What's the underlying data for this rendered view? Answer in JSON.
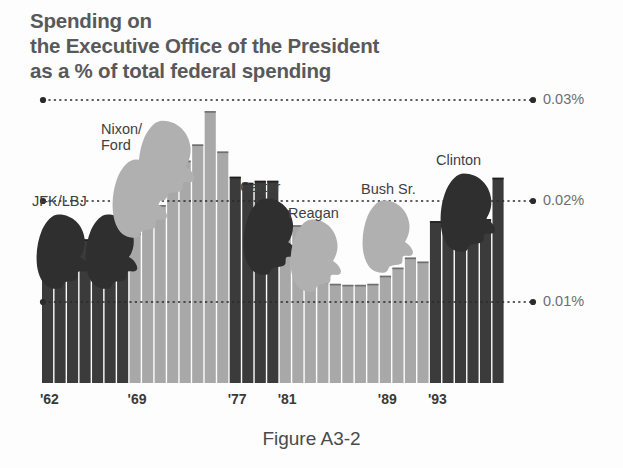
{
  "title": {
    "line1": "Spending on",
    "line2": "the Executive Office of the President",
    "line3": "as a % of total federal spending"
  },
  "caption": "Figure A3-2",
  "colors": {
    "dark_bar": "#3b3b3b",
    "light_bar": "#a8a8a8",
    "title_text": "#58595b",
    "axis_text": "#6d6e71",
    "gridline": "#2b2b2b",
    "background": "#fdfdfd"
  },
  "chart_data": {
    "type": "bar",
    "title": "Spending on the Executive Office of the President as a % of total federal spending",
    "xlabel": "",
    "ylabel": "",
    "ylim": [
      0,
      0.032
    ],
    "grid": true,
    "gridlines": [
      {
        "value": 0.03,
        "label": "0.03%"
      },
      {
        "value": 0.02,
        "label": "0.02%"
      },
      {
        "value": 0.01,
        "label": "0.01%"
      }
    ],
    "ytick_labels": [
      "0.03%",
      "0.02%",
      "0.01%"
    ],
    "xtick_labels": [
      "'62",
      "'69",
      "'77",
      "'81",
      "'89",
      "'93"
    ],
    "xtick_years": [
      1962,
      1969,
      1977,
      1981,
      1989,
      1993
    ],
    "legend_position": "none",
    "categories": [
      1962,
      1963,
      1964,
      1965,
      1966,
      1967,
      1968,
      1969,
      1970,
      1971,
      1972,
      1973,
      1974,
      1975,
      1976,
      1977,
      1978,
      1979,
      1980,
      1981,
      1982,
      1983,
      1984,
      1985,
      1986,
      1987,
      1988,
      1989,
      1990,
      1991,
      1992,
      1993,
      1994,
      1995,
      1996,
      1997,
      1998
    ],
    "values": [
      0.0148,
      0.015,
      0.0155,
      0.0162,
      0.0148,
      0.015,
      0.0155,
      0.0168,
      0.018,
      0.0196,
      0.0216,
      0.024,
      0.0256,
      0.0289,
      0.0249,
      0.0224,
      0.0218,
      0.022,
      0.022,
      0.0191,
      0.0176,
      0.0172,
      0.012,
      0.0118,
      0.0117,
      0.0117,
      0.0118,
      0.0126,
      0.0134,
      0.0144,
      0.014,
      0.018,
      0.0195,
      0.0168,
      0.018,
      0.0182,
      0.0223
    ],
    "bar_group_shade": [
      "dark",
      "dark",
      "dark",
      "dark",
      "dark",
      "dark",
      "dark",
      "light",
      "light",
      "light",
      "light",
      "light",
      "light",
      "light",
      "light",
      "dark",
      "dark",
      "dark",
      "dark",
      "light",
      "light",
      "light",
      "light",
      "light",
      "light",
      "light",
      "light",
      "light",
      "light",
      "light",
      "light",
      "dark",
      "dark",
      "dark",
      "dark",
      "dark",
      "dark"
    ],
    "annotations": [
      {
        "label": "JFK/LBJ",
        "silhouettes": 2,
        "shade": "dark"
      },
      {
        "label": "Nixon/\nFord",
        "silhouettes": 2,
        "shade": "light"
      },
      {
        "label": "Carter",
        "silhouettes": 1,
        "shade": "dark"
      },
      {
        "label": "Reagan",
        "silhouettes": 1,
        "shade": "light"
      },
      {
        "label": "Bush Sr.",
        "silhouettes": 1,
        "shade": "light"
      },
      {
        "label": "Clinton",
        "silhouettes": 1,
        "shade": "dark"
      }
    ]
  },
  "president_labels": {
    "jfk_lbj": "JFK/LBJ",
    "nixon": "Nixon/",
    "ford": "Ford",
    "carter": "Carter",
    "reagan": "Reagan",
    "bush": "Bush Sr.",
    "clinton": "Clinton"
  }
}
